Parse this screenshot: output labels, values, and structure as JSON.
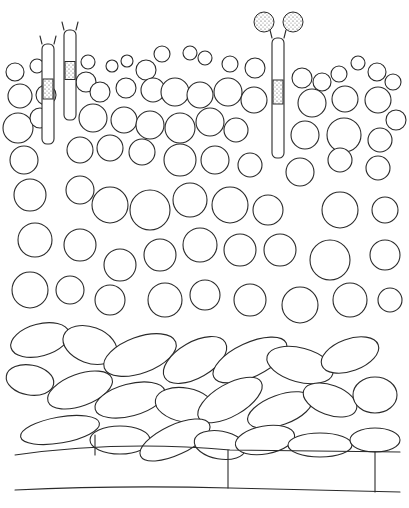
{
  "figure": {
    "title": "",
    "stroke_color": "#2a2a2a",
    "background": "#ffffff"
  },
  "spores": [
    {
      "cx": 264,
      "cy": 22,
      "r": 10
    },
    {
      "cx": 293,
      "cy": 22,
      "r": 10
    }
  ],
  "basidia": [
    {
      "x": 272,
      "y": 38,
      "w": 12,
      "h": 120
    },
    {
      "x": 64,
      "y": 30,
      "w": 12,
      "h": 90
    },
    {
      "x": 42,
      "y": 44,
      "w": 12,
      "h": 100
    }
  ],
  "upper_cells": [
    [
      15,
      72,
      9
    ],
    [
      37,
      66,
      7
    ],
    [
      88,
      62,
      7
    ],
    [
      112,
      66,
      6
    ],
    [
      127,
      61,
      6
    ],
    [
      146,
      70,
      10
    ],
    [
      162,
      54,
      8
    ],
    [
      190,
      53,
      7
    ],
    [
      205,
      58,
      7
    ],
    [
      230,
      64,
      8
    ],
    [
      255,
      68,
      10
    ],
    [
      302,
      78,
      10
    ],
    [
      322,
      82,
      9
    ],
    [
      339,
      74,
      8
    ],
    [
      358,
      63,
      7
    ],
    [
      377,
      72,
      9
    ],
    [
      393,
      82,
      8
    ],
    [
      20,
      96,
      12
    ],
    [
      46,
      95,
      10
    ],
    [
      86,
      82,
      10
    ],
    [
      100,
      92,
      10
    ],
    [
      126,
      88,
      10
    ],
    [
      153,
      90,
      12
    ],
    [
      175,
      92,
      14
    ],
    [
      200,
      95,
      13
    ],
    [
      228,
      92,
      14
    ],
    [
      254,
      100,
      13
    ],
    [
      312,
      103,
      14
    ],
    [
      345,
      99,
      13
    ],
    [
      378,
      100,
      13
    ],
    [
      396,
      120,
      10
    ],
    [
      18,
      128,
      15
    ],
    [
      40,
      118,
      10
    ],
    [
      93,
      118,
      14
    ],
    [
      124,
      120,
      13
    ],
    [
      150,
      125,
      14
    ],
    [
      180,
      128,
      15
    ],
    [
      210,
      122,
      14
    ],
    [
      236,
      130,
      12
    ],
    [
      305,
      135,
      14
    ],
    [
      344,
      135,
      17
    ],
    [
      380,
      140,
      12
    ],
    [
      24,
      160,
      14
    ],
    [
      80,
      150,
      13
    ],
    [
      110,
      148,
      13
    ],
    [
      142,
      152,
      13
    ],
    [
      180,
      160,
      16
    ],
    [
      215,
      160,
      14
    ],
    [
      250,
      165,
      12
    ],
    [
      300,
      172,
      14
    ],
    [
      340,
      160,
      12
    ],
    [
      378,
      168,
      12
    ],
    [
      30,
      195,
      16
    ],
    [
      80,
      190,
      14
    ],
    [
      110,
      205,
      18
    ],
    [
      150,
      210,
      20
    ],
    [
      190,
      200,
      17
    ],
    [
      230,
      205,
      18
    ],
    [
      268,
      210,
      15
    ],
    [
      340,
      210,
      18
    ],
    [
      385,
      210,
      13
    ],
    [
      35,
      240,
      17
    ],
    [
      80,
      245,
      16
    ],
    [
      120,
      265,
      16
    ],
    [
      160,
      255,
      16
    ],
    [
      200,
      245,
      17
    ],
    [
      240,
      250,
      16
    ],
    [
      280,
      250,
      16
    ],
    [
      330,
      260,
      20
    ],
    [
      385,
      255,
      15
    ],
    [
      30,
      290,
      18
    ],
    [
      70,
      290,
      14
    ],
    [
      110,
      300,
      15
    ],
    [
      165,
      300,
      17
    ],
    [
      205,
      295,
      15
    ],
    [
      250,
      300,
      16
    ],
    [
      300,
      305,
      18
    ],
    [
      350,
      300,
      17
    ],
    [
      390,
      300,
      12
    ]
  ],
  "lower_cells": [
    [
      40,
      340,
      30,
      16,
      -15
    ],
    [
      90,
      345,
      28,
      18,
      20
    ],
    [
      140,
      355,
      38,
      18,
      -20
    ],
    [
      195,
      360,
      35,
      18,
      -30
    ],
    [
      250,
      360,
      40,
      17,
      -25
    ],
    [
      300,
      365,
      34,
      17,
      15
    ],
    [
      350,
      355,
      30,
      16,
      -20
    ],
    [
      30,
      380,
      24,
      15,
      10
    ],
    [
      80,
      390,
      34,
      16,
      -20
    ],
    [
      130,
      400,
      36,
      16,
      -15
    ],
    [
      185,
      405,
      30,
      17,
      10
    ],
    [
      230,
      400,
      36,
      16,
      -30
    ],
    [
      280,
      410,
      34,
      15,
      -20
    ],
    [
      330,
      400,
      28,
      15,
      20
    ],
    [
      375,
      395,
      22,
      18,
      0
    ],
    [
      60,
      430,
      40,
      13,
      -10
    ],
    [
      120,
      440,
      30,
      14,
      0
    ],
    [
      175,
      440,
      38,
      15,
      -25
    ],
    [
      220,
      445,
      26,
      14,
      10
    ],
    [
      265,
      440,
      30,
      14,
      -10
    ],
    [
      320,
      445,
      32,
      12,
      0
    ],
    [
      375,
      440,
      25,
      12,
      0
    ]
  ],
  "base_lines": [
    "M15 455 Q120 440 230 450 L400 452",
    "M15 490 Q120 485 230 488 L400 492",
    "M95 435 L95 455",
    "M228 450 L228 488",
    "M375 452 L375 492"
  ]
}
